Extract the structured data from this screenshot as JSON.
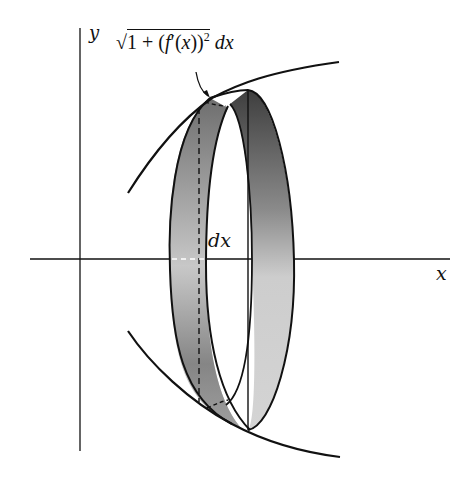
{
  "diagram": {
    "axes": {
      "x_label": "x",
      "y_label": "y"
    },
    "labels": {
      "arc_length_formula": {
        "radical": "√",
        "radicand_parts": [
          "1 + (",
          "f",
          "′(",
          "x",
          "))",
          "2"
        ],
        "suffix": "dx"
      },
      "band_width": "dx"
    },
    "colors": {
      "stroke": "#111111",
      "band_dark": "#555555",
      "band_light": "#d6d6d6",
      "background": "#ffffff"
    }
  }
}
